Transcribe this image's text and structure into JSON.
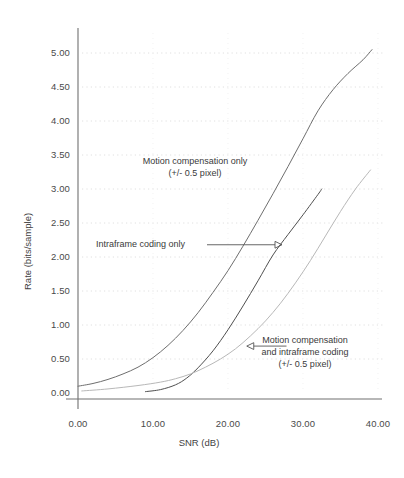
{
  "chart_data": {
    "type": "line",
    "title": "",
    "xlabel": "SNR (dB)",
    "ylabel": "Rate (bits/sample)",
    "xlim": [
      0,
      40
    ],
    "ylim": [
      0,
      5.25
    ],
    "grid": true,
    "grid_style": "dotted horizontal",
    "legend": "none (inline annotations with arrows)",
    "xticks": [
      "0.00",
      "10.00",
      "20.00",
      "30.00",
      "40.00"
    ],
    "xtick_values": [
      0,
      10,
      20,
      30,
      40
    ],
    "yticks": [
      "0.00",
      "0.50",
      "1.00",
      "1.50",
      "2.00",
      "2.50",
      "3.00",
      "3.50",
      "4.00",
      "4.50",
      "5.00"
    ],
    "ytick_values": [
      0,
      0.5,
      1,
      1.5,
      2,
      2.5,
      3,
      3.5,
      4,
      4.5,
      5
    ],
    "series": [
      {
        "name": "Motion compensation only (+/- 0.5 pixel)",
        "color": "#6e6e6e",
        "points": [
          [
            0.0,
            0.1
          ],
          [
            2.0,
            0.14
          ],
          [
            4.0,
            0.2
          ],
          [
            6.0,
            0.28
          ],
          [
            8.0,
            0.38
          ],
          [
            10.0,
            0.52
          ],
          [
            12.0,
            0.7
          ],
          [
            14.0,
            0.92
          ],
          [
            16.0,
            1.18
          ],
          [
            18.0,
            1.48
          ],
          [
            20.0,
            1.8
          ],
          [
            22.0,
            2.16
          ],
          [
            24.0,
            2.54
          ],
          [
            26.0,
            2.93
          ],
          [
            28.0,
            3.33
          ],
          [
            30.0,
            3.74
          ],
          [
            32.0,
            4.15
          ],
          [
            34.0,
            4.46
          ],
          [
            36.0,
            4.7
          ],
          [
            38.0,
            4.9
          ],
          [
            39.2,
            5.05
          ]
        ]
      },
      {
        "name": "Intraframe coding only",
        "color": "#4f4f4f",
        "points": [
          [
            9.0,
            0.02
          ],
          [
            11.0,
            0.05
          ],
          [
            13.0,
            0.12
          ],
          [
            14.5,
            0.22
          ],
          [
            16.0,
            0.37
          ],
          [
            18.0,
            0.62
          ],
          [
            20.0,
            0.93
          ],
          [
            22.0,
            1.28
          ],
          [
            24.0,
            1.65
          ],
          [
            26.0,
            2.03
          ],
          [
            28.0,
            2.33
          ],
          [
            30.0,
            2.62
          ],
          [
            32.0,
            2.92
          ],
          [
            32.5,
            3.0
          ]
        ]
      },
      {
        "name": "Motion compensation and intraframe coding (+/- 0.5 pixel)",
        "color": "#b8b8b8",
        "points": [
          [
            0.5,
            0.03
          ],
          [
            4.0,
            0.06
          ],
          [
            8.0,
            0.11
          ],
          [
            11.0,
            0.16
          ],
          [
            13.0,
            0.21
          ],
          [
            15.0,
            0.28
          ],
          [
            17.0,
            0.38
          ],
          [
            19.0,
            0.5
          ],
          [
            21.0,
            0.65
          ],
          [
            23.0,
            0.84
          ],
          [
            25.0,
            1.06
          ],
          [
            27.0,
            1.32
          ],
          [
            29.0,
            1.62
          ],
          [
            31.0,
            1.95
          ],
          [
            33.0,
            2.31
          ],
          [
            35.0,
            2.67
          ],
          [
            37.0,
            3.0
          ],
          [
            39.0,
            3.28
          ]
        ]
      }
    ],
    "annotations": [
      {
        "id": "motion-compensation-only",
        "line1": "Motion compensation only",
        "line2": "(+/- 0.5 pixel)",
        "arrow": "none"
      },
      {
        "id": "intraframe-coding-only",
        "line1": "Intraframe coding only",
        "line2": "",
        "arrow": "right",
        "arrow_from_x": 17.2,
        "arrow_from_y": 2.18,
        "arrow_to_x": 27.2,
        "arrow_to_y": 2.18
      },
      {
        "id": "motion-compensation-and-intraframe-coding",
        "line1": "Motion compensation",
        "line2": "and intraframe coding",
        "line3": "(+/- 0.5 pixel)",
        "arrow": "left",
        "arrow_from_x": 27.8,
        "arrow_from_y": 0.69,
        "arrow_to_x": 22.5,
        "arrow_to_y": 0.69
      }
    ],
    "colors": {
      "axis": "#707070",
      "grid": "#d8d8d8",
      "text": "#3a3a3a",
      "background": "#ffffff"
    }
  }
}
